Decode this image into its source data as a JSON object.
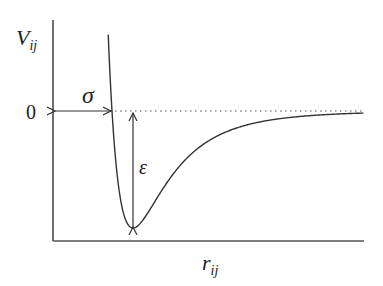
{
  "diagram": {
    "y_axis_label": {
      "main": "V",
      "sub": "ij"
    },
    "x_axis_label": {
      "main": "r",
      "sub": "ij"
    },
    "zero_label": "0",
    "sigma_label": "σ",
    "epsilon_label": "ε",
    "colors": {
      "stroke": "#333333",
      "dotted": "#555555",
      "background": "#ffffff"
    }
  },
  "chart_data": {
    "type": "line",
    "title": "",
    "xlabel": "r_ij",
    "ylabel": "V_ij",
    "series": [
      {
        "name": "Lennard-Jones potential V(r) = 4ε[(σ/r)^12 − (σ/r)^6]",
        "epsilon": 1,
        "sigma": 1
      }
    ],
    "annotations": [
      {
        "label": "σ",
        "description": "distance from origin to zero crossing"
      },
      {
        "label": "ε",
        "description": "depth of potential well"
      },
      {
        "label": "0",
        "description": "zero energy level (dotted line)"
      }
    ],
    "grid": false
  }
}
